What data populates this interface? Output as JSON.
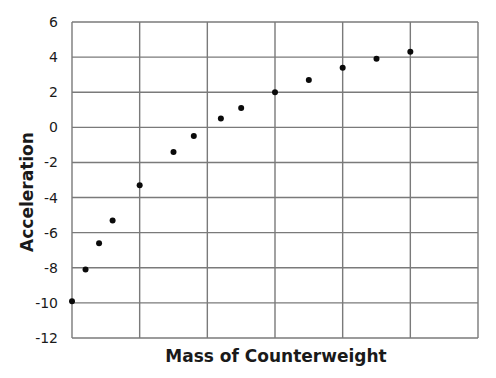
{
  "chart_data": {
    "type": "scatter",
    "title": "",
    "xlabel": "Mass of Counterweight",
    "ylabel": "Acceleration",
    "xlim": [
      0,
      6
    ],
    "ylim": [
      -12,
      6
    ],
    "x_ticks": [],
    "y_ticks": [
      6,
      4,
      2,
      0,
      -2,
      -4,
      -6,
      -8,
      -10,
      -12
    ],
    "y_tick_labels": [
      "6",
      "4",
      "2",
      "0",
      "-2",
      "-4",
      "-6",
      "-8",
      "-10",
      "-12"
    ],
    "x_grid_divisions": 6,
    "grid": true,
    "legend": null,
    "series": [
      {
        "name": "Acceleration vs Mass",
        "color": "#0a0a0a",
        "x": [
          0.0,
          0.2,
          0.4,
          0.6,
          1.0,
          1.5,
          1.8,
          2.2,
          2.5,
          3.0,
          3.5,
          4.0,
          4.5,
          5.0
        ],
        "y": [
          -9.9,
          -8.1,
          -6.6,
          -5.3,
          -3.3,
          -1.4,
          -0.5,
          0.5,
          1.1,
          2.0,
          2.7,
          3.4,
          3.9,
          4.3
        ]
      }
    ]
  },
  "colors": {
    "grid": "#7a7a7a",
    "points": "#0a0a0a",
    "text": "#1a1a1a",
    "background": "#ffffff"
  }
}
